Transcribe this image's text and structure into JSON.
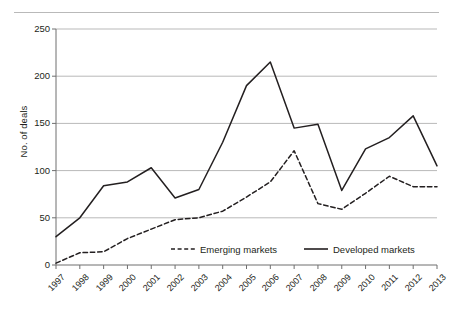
{
  "figure": {
    "top_rule": true,
    "clipped_top_text": "",
    "clipped_bottom_text": ""
  },
  "axis": {
    "y_label": "No. of deals",
    "y_ticks": [
      "0",
      "50",
      "100",
      "150",
      "200",
      "250"
    ],
    "x_ticks": [
      "1997",
      "1998",
      "1999",
      "2000",
      "2001",
      "2002",
      "2003",
      "2004",
      "2005",
      "2006",
      "2007",
      "2008",
      "2009",
      "2010",
      "2011",
      "2012",
      "2013"
    ]
  },
  "legend": {
    "items": [
      {
        "label": "Emerging markets",
        "style": "dashed",
        "color": "#231f20"
      },
      {
        "label": "Developed markets",
        "style": "solid",
        "color": "#231f20"
      }
    ]
  },
  "colors": {
    "line": "#231f20",
    "grid": "#b9b9b9",
    "axis": "#6f6f6f",
    "background": "#ffffff"
  },
  "chart_data": {
    "type": "line",
    "title": "",
    "xlabel": "",
    "ylabel": "No. of deals",
    "ylim": [
      0,
      250
    ],
    "ytick_step": 50,
    "grid": true,
    "legend_position": "inside-bottom",
    "categories": [
      "1997",
      "1998",
      "1999",
      "2000",
      "2001",
      "2002",
      "2003",
      "2004",
      "2005",
      "2006",
      "2007",
      "2008",
      "2009",
      "2010",
      "2011",
      "2012",
      "2013"
    ],
    "series": [
      {
        "name": "Emerging markets",
        "style": "dashed",
        "values": [
          2,
          13,
          14,
          28,
          38,
          48,
          50,
          57,
          72,
          88,
          121,
          65,
          59,
          76,
          94,
          83,
          83
        ]
      },
      {
        "name": "Developed markets",
        "style": "solid",
        "values": [
          30,
          50,
          84,
          88,
          103,
          71,
          80,
          130,
          190,
          215,
          145,
          149,
          79,
          123,
          135,
          158,
          105
        ]
      }
    ]
  }
}
